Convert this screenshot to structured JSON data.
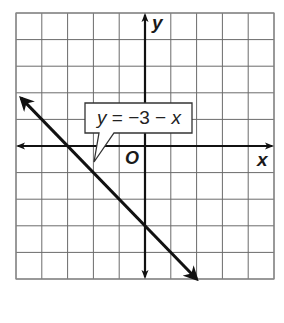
{
  "chart_data": {
    "type": "line",
    "title": "",
    "equation": "y = −3 − x",
    "equation_parts": {
      "lhs": "y",
      "eq": "=",
      "rhs_const": "−3",
      "op": "−",
      "rhs_var": "x"
    },
    "xlabel": "x",
    "ylabel": "y",
    "origin_label": "O",
    "xlim": [
      -5,
      5
    ],
    "ylim": [
      -5,
      5
    ],
    "grid": true,
    "grid_step": 1,
    "series": [
      {
        "name": "y = -3 - x",
        "slope": -1,
        "intercept": -3,
        "points": [
          {
            "x": -4.8,
            "y": 1.8
          },
          {
            "x": -3,
            "y": 0
          },
          {
            "x": 0,
            "y": -3
          },
          {
            "x": 2,
            "y": -5
          }
        ],
        "arrows": "both"
      }
    ],
    "annotations": [
      {
        "text": "y = −3 − x",
        "type": "callout",
        "points_to": {
          "x": -2,
          "y": -0.6
        }
      }
    ]
  },
  "colors": {
    "grid": "#6b6b6b",
    "axis": "#111111",
    "line": "#111111",
    "background": "#ffffff"
  }
}
